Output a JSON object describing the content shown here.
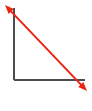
{
  "figure": {
    "title": "",
    "width": 92,
    "height": 111,
    "background_color": "#ffffff"
  },
  "colors": {
    "axis": "#4d4d4d",
    "arrow": "#ee2211",
    "background": "#ffffff"
  },
  "axes": {
    "name": "axis-corner",
    "stroke_color": "#4d4d4d",
    "stroke_width": 2,
    "vertical": {
      "label": "vertical-axis",
      "x1": 14,
      "y1": 8,
      "x2": 14,
      "y2": 80
    },
    "horizontal": {
      "label": "horizontal-axis",
      "x1": 14,
      "y1": 80,
      "x2": 85,
      "y2": 80
    },
    "origin_x": 14,
    "origin_y": 80
  },
  "arrow": {
    "name": "double-headed-diagonal-arrow",
    "stroke_color": "#ee2211",
    "stroke_width": 2,
    "double_headed": true,
    "start_x": 5,
    "start_y": 5,
    "end_x": 87,
    "end_y": 91,
    "head_length": 9,
    "head_width": 7,
    "direction": "top-left to bottom-right"
  },
  "chart_data": {
    "type": "line",
    "title": "",
    "xlabel": "",
    "ylabel": "",
    "x": [
      5,
      87
    ],
    "values": [
      5,
      91
    ],
    "xlim": [
      0,
      92
    ],
    "ylim": [
      0,
      111
    ],
    "grid": false,
    "legend": "none",
    "series": [
      {
        "name": "diagonal-arrow",
        "x": [
          5,
          87
        ],
        "values": [
          5,
          91
        ],
        "color": "#ee2211"
      }
    ],
    "annotations": [
      {
        "name": "arrowhead-top-left",
        "x": 5,
        "y": 5
      },
      {
        "name": "arrowhead-bottom-right",
        "x": 87,
        "y": 91
      }
    ]
  }
}
